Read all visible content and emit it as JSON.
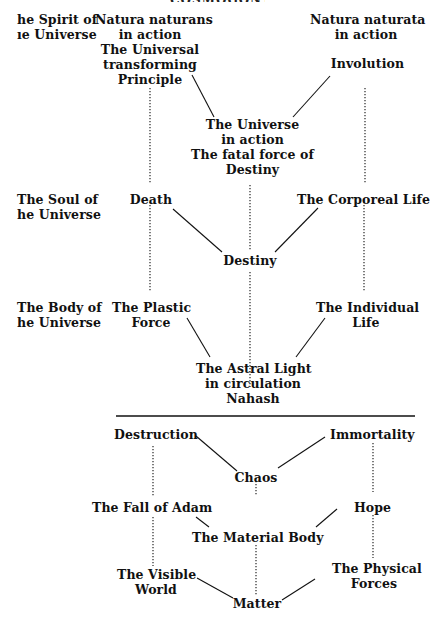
{
  "header": {
    "title_cut": "COSMOGONY"
  },
  "row_labels": [
    {
      "id": "spirit",
      "lines": [
        "he Spirit of",
        "ıe Universe"
      ]
    },
    {
      "id": "soul",
      "lines": [
        "The Soul of",
        "he Universe"
      ]
    },
    {
      "id": "body",
      "lines": [
        "The Body of",
        "he Universe"
      ]
    }
  ],
  "upper": {
    "natura_naturans": [
      "Natura naturans",
      "in action",
      "The Universal",
      "transforming",
      "Principle"
    ],
    "natura_naturata": [
      "Natura naturata",
      "in action"
    ],
    "involution": "Involution",
    "universe_in_action": [
      "The Universe",
      "in action",
      "The fatal force of",
      "Destiny"
    ],
    "death": "Death",
    "corporeal_life": "The Corporeal Life",
    "destiny": "Destiny",
    "plastic_force": [
      "The Plastic",
      "Force"
    ],
    "individual_life": [
      "The Individual",
      "Life"
    ],
    "astral_light": [
      "The Astral Light",
      "in circulation",
      "Nahash"
    ]
  },
  "lower": {
    "destruction": "Destruction",
    "immortality": "Immortality",
    "chaos": "Chaos",
    "fall_of_adam": "The Fall of Adam",
    "hope": "Hope",
    "material_body": "The Material Body",
    "visible_world": [
      "The Visible",
      "World"
    ],
    "physical_forces": [
      "The Physical",
      "Forces"
    ],
    "matter": "Matter"
  },
  "colors": {
    "ink": "#111111",
    "paper": "#ffffff"
  }
}
